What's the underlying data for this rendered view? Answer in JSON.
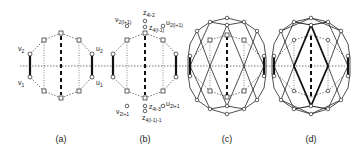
{
  "figure": {
    "panels": [
      {
        "id": "a",
        "caption": "(a)",
        "center_x": 61
      },
      {
        "id": "b",
        "caption": "(b)",
        "center_x": 145
      },
      {
        "id": "c",
        "caption": "(c)",
        "center_x": 227
      },
      {
        "id": "d",
        "caption": "(d)",
        "center_x": 311
      }
    ],
    "labels_a": {
      "v2": {
        "main": "v",
        "sub": "2"
      },
      "v1": {
        "main": "v",
        "sub": "1"
      },
      "u2": {
        "main": "u",
        "sub": "2"
      },
      "u1": {
        "main": "u",
        "sub": "1"
      }
    },
    "labels_b": {
      "v_top": {
        "main": "v",
        "sub": "2(l+1)"
      },
      "u_top": {
        "main": "u",
        "sub": "2(l+1)"
      },
      "z_top1": {
        "main": "z",
        "sub": "4l-2"
      },
      "z_top2": {
        "main": "z",
        "sub": "4(l-1)"
      },
      "v_bot": {
        "main": "v",
        "sub": "2l+1"
      },
      "u_bot": {
        "main": "u",
        "sub": "2l+1"
      },
      "z_bot1": {
        "main": "z",
        "sub": "4l-3"
      },
      "z_bot2": {
        "main": "z",
        "sub": "4(l-1)-1"
      }
    },
    "colors": {
      "stroke": "#222222",
      "dotted": "#555555",
      "node_fill": "#ffffff"
    }
  }
}
